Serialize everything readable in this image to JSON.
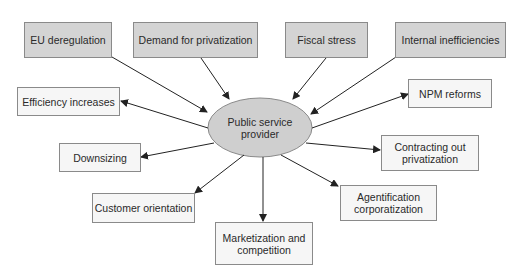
{
  "diagram": {
    "center": {
      "label": "Public service provider",
      "line1": "Public service",
      "line2": "provider",
      "fill": "#cfcfcf"
    },
    "causes": [
      {
        "id": "eu-deregulation",
        "label": "EU deregulation"
      },
      {
        "id": "demand-for-privatization",
        "label": "Demand for privatization"
      },
      {
        "id": "fiscal-stress",
        "label": "Fiscal stress"
      },
      {
        "id": "internal-inefficiencies",
        "label": "Internal inefficiencies"
      }
    ],
    "effects": [
      {
        "id": "efficiency-increases",
        "label": "Efficiency increases"
      },
      {
        "id": "npm-reforms",
        "label": "NPM reforms"
      },
      {
        "id": "downsizing",
        "label": "Downsizing"
      },
      {
        "id": "contracting-out-privatization",
        "label": "Contracting out privatization",
        "line1": "Contracting out",
        "line2": "privatization"
      },
      {
        "id": "customer-orientation",
        "label": "Customer orientation"
      },
      {
        "id": "agentification-corporatization",
        "label": "Agentification corporatization",
        "line1": "Agentification",
        "line2": "corporatization"
      },
      {
        "id": "marketization-and-competition",
        "label": "Marketization and competition",
        "line1": "Marketization and",
        "line2": "competition"
      }
    ],
    "colors": {
      "cause_fill": "#d4d4d4",
      "effect_fill": "#f6f6f6",
      "border": "#8a8a8a",
      "arrow": "#222222"
    }
  }
}
